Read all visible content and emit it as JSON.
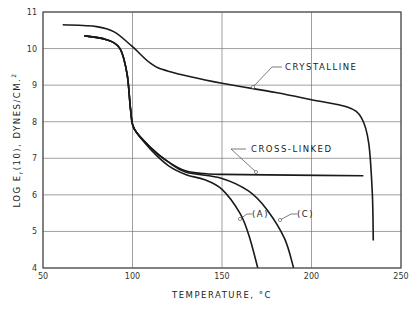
{
  "chart_data": {
    "type": "line",
    "title": "",
    "xlabel": "TEMPERATURE, °C",
    "ylabel": "LOG Er(10), DYNES/CM.2",
    "xlim": [
      50,
      250
    ],
    "ylim": [
      4,
      11
    ],
    "xticks": [
      50,
      100,
      150,
      200,
      250
    ],
    "yticks": [
      4,
      5,
      6,
      7,
      8,
      9,
      10,
      11
    ],
    "grid": true,
    "series": [
      {
        "name": "CRYSTALLINE",
        "x": [
          61,
          80,
          90,
          100,
          110,
          120,
          150,
          180,
          200,
          220,
          228,
          232,
          234,
          234.5
        ],
        "y": [
          10.65,
          10.6,
          10.45,
          10.05,
          9.6,
          9.38,
          9.05,
          8.8,
          8.6,
          8.4,
          8.1,
          7.4,
          6.0,
          4.75
        ]
      },
      {
        "name": "CROSS-LINKED",
        "x": [
          73,
          85,
          93,
          97,
          99,
          101,
          110,
          120,
          130,
          140,
          150,
          190,
          229
        ],
        "y": [
          10.35,
          10.25,
          10.0,
          9.3,
          8.3,
          7.8,
          7.3,
          6.9,
          6.65,
          6.58,
          6.56,
          6.54,
          6.52
        ]
      },
      {
        "name": "(A)",
        "x": [
          73,
          85,
          93,
          97,
          99,
          101,
          110,
          120,
          130,
          140,
          150,
          160,
          165,
          170
        ],
        "y": [
          10.35,
          10.25,
          10.0,
          9.3,
          8.3,
          7.8,
          7.25,
          6.8,
          6.55,
          6.42,
          6.15,
          5.5,
          4.9,
          4.0
        ]
      },
      {
        "name": "(C)",
        "x": [
          73,
          85,
          93,
          97,
          99,
          101,
          110,
          120,
          130,
          150,
          165,
          175,
          185,
          190
        ],
        "y": [
          10.35,
          10.25,
          10.0,
          9.3,
          8.3,
          7.8,
          7.3,
          6.9,
          6.62,
          6.45,
          6.1,
          5.6,
          4.8,
          4.0
        ]
      }
    ],
    "annotations": [
      {
        "text": "CRYSTALLINE",
        "at": [
          178,
          8.85
        ]
      },
      {
        "text": "CROSS-LINKED",
        "at": [
          160,
          6.56
        ]
      },
      {
        "text": "(A)",
        "at": [
          155,
          5.0
        ]
      },
      {
        "text": "(C)",
        "at": [
          180,
          5.0
        ]
      }
    ]
  },
  "labels": {
    "xlabel": "TEMPERATURE, °C",
    "ylabel_main": "LOG E",
    "ylabel_sub": "r",
    "ylabel_rest": "(10), DYNES/CM.",
    "ylabel_sup": "2",
    "crystalline": "CRYSTALLINE",
    "crosslinked": "CROSS-LINKED",
    "a": "(A)",
    "c": "(C)"
  }
}
